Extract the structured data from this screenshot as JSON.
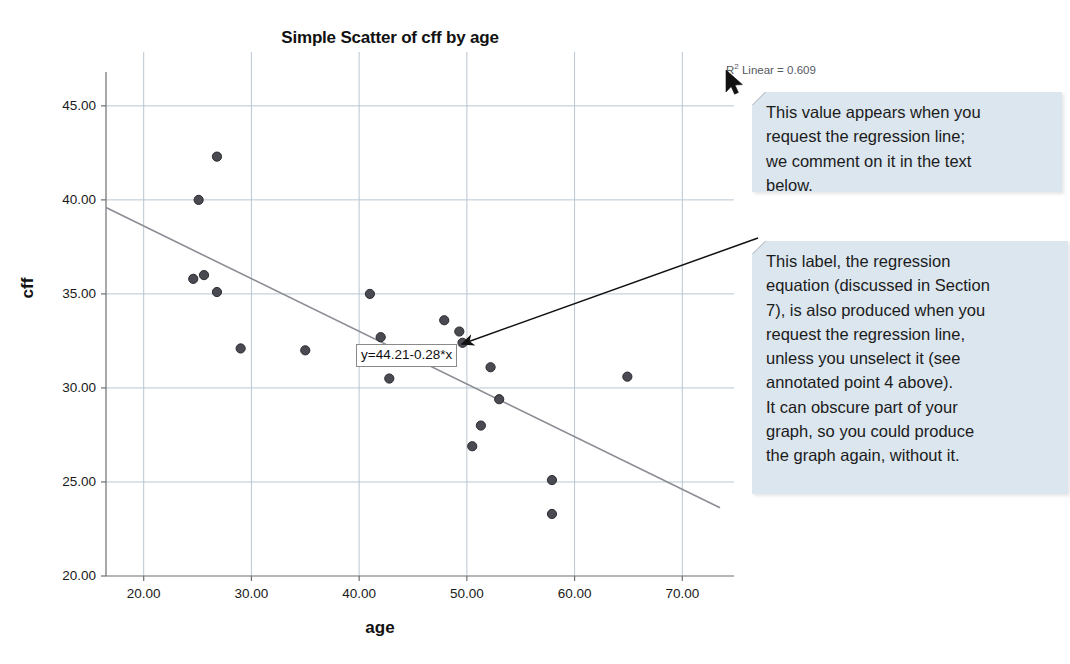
{
  "chart_data": {
    "type": "scatter",
    "title": "Simple Scatter of cff by age",
    "xlabel": "age",
    "ylabel": "cff",
    "xlim": [
      16.5,
      73.5
    ],
    "ylim": [
      20.0,
      46.8
    ],
    "xticks": [
      "20.00",
      "30.00",
      "40.00",
      "50.00",
      "60.00",
      "70.00"
    ],
    "xtick_values": [
      20,
      30,
      40,
      50,
      60,
      70
    ],
    "yticks": [
      "20.00",
      "25.00",
      "30.00",
      "35.00",
      "40.00",
      "45.00"
    ],
    "ytick_values": [
      20,
      25,
      30,
      35,
      40,
      45
    ],
    "grid": true,
    "legend": "none",
    "marker_color": "#4a4a52",
    "line_color": "#8c8c94",
    "points": [
      {
        "x": 26.8,
        "y": 42.3
      },
      {
        "x": 25.1,
        "y": 40.0
      },
      {
        "x": 24.6,
        "y": 35.8
      },
      {
        "x": 25.6,
        "y": 36.0
      },
      {
        "x": 26.8,
        "y": 35.1
      },
      {
        "x": 29.0,
        "y": 32.1
      },
      {
        "x": 35.0,
        "y": 32.0
      },
      {
        "x": 41.0,
        "y": 35.0
      },
      {
        "x": 42.0,
        "y": 32.7
      },
      {
        "x": 42.8,
        "y": 30.5
      },
      {
        "x": 47.9,
        "y": 33.6
      },
      {
        "x": 49.3,
        "y": 33.0
      },
      {
        "x": 49.6,
        "y": 32.4
      },
      {
        "x": 52.2,
        "y": 31.1
      },
      {
        "x": 53.0,
        "y": 29.4
      },
      {
        "x": 51.3,
        "y": 28.0
      },
      {
        "x": 50.5,
        "y": 26.9
      },
      {
        "x": 57.9,
        "y": 25.1
      },
      {
        "x": 57.9,
        "y": 23.3
      },
      {
        "x": 64.9,
        "y": 30.6
      }
    ],
    "regression": {
      "equation_label": "y=44.21-0.28*x",
      "intercept": 44.21,
      "slope": -0.28,
      "r_squared_label": "R² Linear = 0.609",
      "r_squared_prefix": "R",
      "r_squared_superscript": "2",
      "r_squared_suffix": " Linear = 0.609",
      "r_squared_value": 0.609
    }
  },
  "annotations": {
    "rsquared_callout": {
      "lines": [
        "This value appears when you",
        "request the regression line;",
        "we comment on it in the text",
        "below."
      ]
    },
    "equation_callout": {
      "lines": [
        "This label, the regression",
        "equation (discussed in Section",
        "7), is also produced when you",
        "request the regression line,",
        "unless you unselect it (see",
        "annotated point 4 above).",
        "It can obscure part of your",
        "graph, so you could produce",
        "the graph again, without it."
      ]
    },
    "cursor": {
      "name": "mouse-pointer"
    }
  },
  "colors": {
    "callout_background": "#dce6ef",
    "grid": "#b9c6d2",
    "axis": "#6f6f6f",
    "marker": "#4a4a52",
    "regression_line": "#8c8c94"
  }
}
